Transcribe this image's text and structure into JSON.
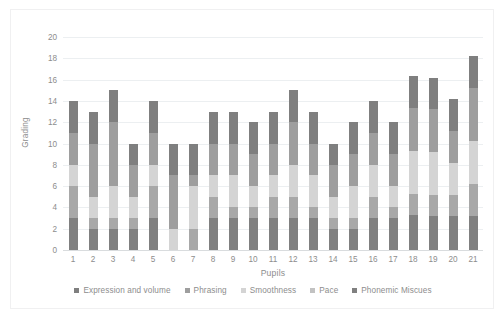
{
  "chart_data": {
    "type": "bar",
    "subtype": "stacked-bar",
    "title": "",
    "xlabel": "Pupils",
    "ylabel": "Grading",
    "ylim": [
      0,
      20
    ],
    "ytick_step": 2,
    "yticks": [
      20,
      18,
      16,
      14,
      12,
      10,
      8,
      6,
      4,
      2,
      0
    ],
    "grid": true,
    "legend_position": "bottom",
    "categories": [
      "1",
      "2",
      "3",
      "4",
      "5",
      "6",
      "7",
      "8",
      "9",
      "10",
      "11",
      "12",
      "13",
      "14",
      "15",
      "16",
      "17",
      "18",
      "19",
      "20",
      "21"
    ],
    "stack_order_bottom_to_top": [
      "Phonemic Miscues",
      "Pace",
      "Smoothness",
      "Phrasing",
      "Expression and volume"
    ],
    "series": [
      {
        "name": "Expression and volume",
        "color": "#7f7f7f",
        "values": [
          3,
          3,
          3,
          2,
          3,
          3,
          3,
          3,
          3,
          3,
          3,
          3,
          3,
          2,
          3,
          3,
          3,
          3,
          3,
          3,
          3
        ]
      },
      {
        "name": "Phrasing",
        "color": "#9e9e9e",
        "values": [
          3,
          5,
          6,
          3,
          3,
          5,
          1,
          3,
          3,
          3,
          3,
          4,
          3,
          3,
          3,
          3,
          3,
          4,
          4,
          3,
          5
        ]
      },
      {
        "name": "Smoothness",
        "color": "#d4d4d4",
        "values": [
          2,
          2,
          3,
          2,
          2,
          2,
          4,
          2,
          3,
          2,
          2,
          3,
          3,
          2,
          3,
          3,
          2,
          4,
          4,
          3,
          4
        ]
      },
      {
        "name": "Pace",
        "color": "#a8a8a8",
        "values": [
          3,
          1,
          1,
          1,
          3,
          0,
          2,
          2,
          1,
          1,
          2,
          2,
          1,
          1,
          1,
          2,
          1,
          2,
          2,
          2,
          3
        ]
      },
      {
        "name": "Phonemic Miscues",
        "color": "#808080",
        "values": [
          3,
          2,
          2,
          2,
          3,
          0,
          0,
          3,
          3,
          3,
          3,
          3,
          3,
          2,
          2,
          3,
          3,
          3.3,
          3.2,
          3.2,
          3.2
        ]
      }
    ],
    "totals": [
      14,
      13,
      15,
      10,
      14,
      10,
      10,
      13,
      13,
      12,
      13,
      15,
      13,
      10,
      12,
      14,
      12,
      16.3,
      16.2,
      14.2,
      18.2
    ]
  },
  "legend": {
    "items": [
      {
        "label": "Expression and volume",
        "color": "#7f7f7f"
      },
      {
        "label": "Phrasing",
        "color": "#9e9e9e"
      },
      {
        "label": "Smoothness",
        "color": "#d4d4d4"
      },
      {
        "label": "Pace",
        "color": "#c2c2c2"
      },
      {
        "label": "Phonemic Miscues",
        "color": "#808080"
      }
    ]
  },
  "axes": {
    "y_title": "Grading",
    "x_title": "Pupils"
  }
}
